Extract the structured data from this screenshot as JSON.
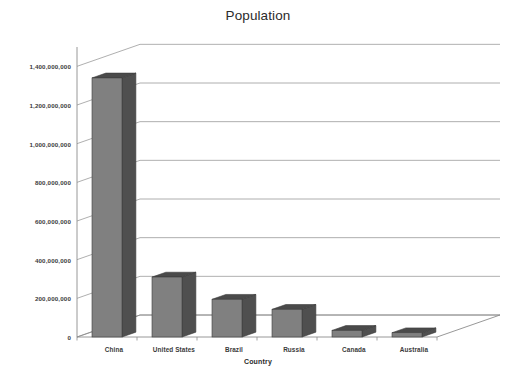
{
  "chart_data": {
    "type": "bar",
    "title": "Population",
    "subtitle": "",
    "xlabel": "Country",
    "ylabel": "",
    "categories": [
      "China",
      "United States",
      "Brazil",
      "Russia",
      "Canada",
      "Australia"
    ],
    "values": [
      1340000000,
      310000000,
      195000000,
      143000000,
      34000000,
      22000000
    ],
    "series": [
      {
        "name": "Population",
        "values": [
          1340000000,
          310000000,
          195000000,
          143000000,
          34000000,
          22000000
        ]
      }
    ],
    "ylim": [
      0,
      1500000000
    ],
    "ytick_values": [
      0,
      200000000,
      400000000,
      600000000,
      800000000,
      1000000000,
      1200000000,
      1400000000
    ],
    "ytick_labels": [
      "0",
      "200,000,000",
      "400,000,000",
      "600,000,000",
      "800,000,000",
      "1,000,000,000",
      "1,200,000,000",
      "1,400,000,000"
    ],
    "grid": true,
    "grid_axis": "y",
    "legend": false,
    "legend_position": "none",
    "projection": "3d",
    "colors": {
      "bar_front": "#808080",
      "bar_side": "#4f4f4f",
      "bar_top": "#4a4a4a",
      "bar_outline": "#3c3c3c",
      "gridline": "#9a9a9a",
      "axis": "#8c8c8c",
      "floor": "#ffffff",
      "background": "#ffffff",
      "title_text": "#2b2b2b",
      "tick_text": "#3a3a3a"
    }
  },
  "axis_labels": {
    "y": [
      "1,400,000,000",
      "1,200,000,000",
      "1,000,000,000",
      "800,000,000",
      "600,000,000",
      "400,000,000",
      "200,000,000",
      "0"
    ],
    "x": [
      "China",
      "United States",
      "Brazil",
      "Russia",
      "Canada",
      "Australia"
    ]
  }
}
